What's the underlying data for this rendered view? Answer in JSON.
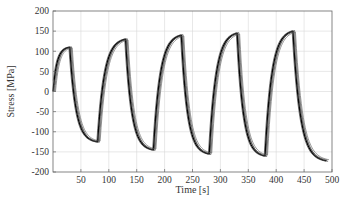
{
  "chart_data": {
    "type": "line",
    "title": "",
    "xlabel": "Time [s]",
    "ylabel": "Stress [MPa]",
    "xlim": [
      0,
      500
    ],
    "ylim": [
      -200,
      200
    ],
    "xticks": [
      50,
      100,
      150,
      200,
      250,
      300,
      350,
      400,
      450,
      500
    ],
    "yticks": [
      200,
      150,
      100,
      50,
      0,
      -50,
      -100,
      -150,
      -200
    ],
    "grid": true,
    "legend": "none",
    "line_color": "#000000",
    "overlay_color": "#555555",
    "cycles": [
      {
        "start_t": 0,
        "peak_t": 30,
        "peak": 110,
        "trough_t": 80,
        "trough": -125
      },
      {
        "start_t": 80,
        "peak_t": 130,
        "peak": 130,
        "trough_t": 180,
        "trough": -145
      },
      {
        "start_t": 180,
        "peak_t": 230,
        "peak": 140,
        "trough_t": 280,
        "trough": -155
      },
      {
        "start_t": 280,
        "peak_t": 330,
        "peak": 145,
        "trough_t": 380,
        "trough": -160
      },
      {
        "start_t": 380,
        "peak_t": 430,
        "peak": 150,
        "trough_t": 490,
        "trough": -172
      }
    ],
    "series": [
      {
        "name": "run-1",
        "time_offset": 0,
        "amp_scale": 1.0,
        "shade": "#000000"
      },
      {
        "name": "run-2",
        "time_offset": 1.5,
        "amp_scale": 0.99,
        "shade": "#222222"
      },
      {
        "name": "run-3",
        "time_offset": 3,
        "amp_scale": 1.01,
        "shade": "#444444"
      },
      {
        "name": "run-4",
        "time_offset": 4.5,
        "amp_scale": 0.985,
        "shade": "#666666"
      },
      {
        "name": "run-5",
        "time_offset": -1.5,
        "amp_scale": 1.005,
        "shade": "#333333"
      }
    ]
  }
}
